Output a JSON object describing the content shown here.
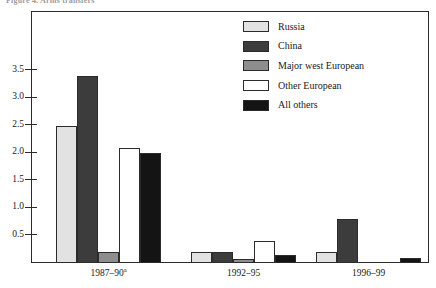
{
  "caption": "Figure 4. Arms transfers",
  "chart_data": {
    "type": "bar",
    "title": "",
    "subtitle": "",
    "xlabel": "",
    "ylabel": "",
    "grid": false,
    "legend_position": "top-right",
    "categories": [
      "1987–90",
      "1992–95",
      "1996–99"
    ],
    "category_labels": [
      "1987–90",
      "1992–95",
      "1996–99"
    ],
    "category_footnotes": [
      "a",
      "",
      ""
    ],
    "ylim": [
      0,
      3.75
    ],
    "yticks": [
      0.5,
      1.0,
      1.5,
      2.0,
      2.5,
      3.0,
      3.5
    ],
    "ytick_labels": [
      "0.5",
      "1.0",
      "1.5",
      "2.0",
      "2.5",
      "3.0",
      "3.5"
    ],
    "series": [
      {
        "name": "Russia",
        "color": "#e2e2e2",
        "values": [
          2.5,
          0.2,
          0.2
        ]
      },
      {
        "name": "China",
        "color": "#3c3c3c",
        "values": [
          3.4,
          0.2,
          0.8
        ]
      },
      {
        "name": "Major west European",
        "color": "#8d8d8d",
        "values": [
          0.2,
          0.08,
          0.0
        ]
      },
      {
        "name": "Other European",
        "color": "#ffffff",
        "values": [
          2.1,
          0.4,
          0.0
        ]
      },
      {
        "name": "All others",
        "color": "#141414",
        "values": [
          2.0,
          0.15,
          0.1
        ]
      }
    ]
  },
  "legend": {
    "items": [
      {
        "label": "Russia",
        "color": "#e2e2e2"
      },
      {
        "label": "China",
        "color": "#3c3c3c"
      },
      {
        "label": "Major west European",
        "color": "#8d8d8d"
      },
      {
        "label": "Other European",
        "color": "#ffffff"
      },
      {
        "label": "All others",
        "color": "#141414"
      }
    ]
  },
  "colors": {
    "axis": "#2b2b2b",
    "text": "#1a1a1a",
    "background": "#ffffff"
  }
}
